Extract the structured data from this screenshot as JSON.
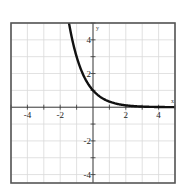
{
  "chart_data": {
    "type": "line",
    "title": "",
    "xlabel": "x",
    "ylabel": "y",
    "xlim": [
      -5,
      5
    ],
    "ylim": [
      -4.5,
      5
    ],
    "grid": true,
    "x_ticks": [
      -4,
      -2,
      2,
      4
    ],
    "y_ticks": [
      4,
      2,
      -2,
      -4
    ],
    "x_tick_labels": [
      "-4",
      "-2",
      "2",
      "4"
    ],
    "y_tick_labels": [
      "4",
      "2",
      "-2",
      "-4"
    ],
    "series": [
      {
        "name": "y = (1/3)^x",
        "x": [
          -1.46,
          -1.25,
          -1,
          -0.75,
          -0.5,
          -0.25,
          0,
          0.25,
          0.5,
          0.75,
          1,
          1.5,
          2,
          2.5,
          3,
          3.5,
          4,
          4.5,
          5
        ],
        "y": [
          4.97,
          3.95,
          3.0,
          2.28,
          1.73,
          1.32,
          1.0,
          0.76,
          0.58,
          0.44,
          0.33,
          0.19,
          0.11,
          0.06,
          0.04,
          0.02,
          0.01,
          0.01,
          0.0
        ]
      }
    ],
    "legend": null
  },
  "axes": {
    "x_label": "x",
    "y_label": "y"
  },
  "colors": {
    "curve": "#111111",
    "grid": "#d9d9d9",
    "frame": "#555555",
    "axis": "#333333"
  }
}
